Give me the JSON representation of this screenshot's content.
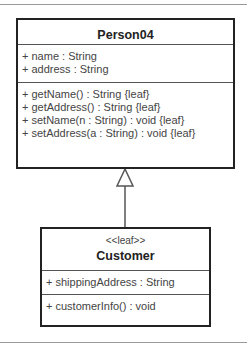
{
  "classes": [
    {
      "name": "Person04",
      "stereotype": null,
      "attributes": [
        "+ name : String",
        "+ address : String"
      ],
      "operations": [
        "+ getName() : String {leaf}",
        "+ getAddress() : String {leaf}",
        "+ setName(n : String) : void {leaf}",
        "+ setAddress(a : String) : void {leaf}"
      ]
    },
    {
      "name": "Customer",
      "stereotype": "<<leaf>>",
      "attributes": [
        "+ shippingAddress : String"
      ],
      "operations": [
        "+ customerInfo() : void"
      ]
    }
  ],
  "relationships": [
    {
      "type": "generalization",
      "from": "Customer",
      "to": "Person04"
    }
  ]
}
